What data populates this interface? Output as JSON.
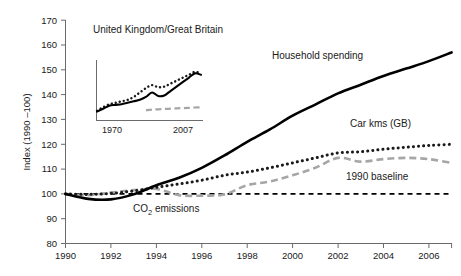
{
  "chart_data": {
    "type": "line",
    "title": "",
    "xlabel": "",
    "ylabel": "Index (1990 –100)",
    "xlim": [
      1990,
      2007
    ],
    "ylim": [
      80,
      170
    ],
    "grid": false,
    "legend_position": "inline-annotations",
    "x_tick_labels": [
      "1990",
      "1992",
      "1994",
      "1996",
      "1998",
      "2000",
      "2002",
      "2004",
      "2006"
    ],
    "y_tick_labels": [
      "80",
      "90",
      "100",
      "110",
      "120",
      "130",
      "140",
      "150",
      "160",
      "170"
    ],
    "x": [
      1990,
      1991,
      1992,
      1993,
      1994,
      1995,
      1996,
      1997,
      1998,
      1999,
      2000,
      2001,
      2002,
      2003,
      2004,
      2005,
      2006,
      2007
    ],
    "series": [
      {
        "name": "Household spending",
        "style": "solid",
        "color": "#000000",
        "values": [
          100,
          98,
          97.8,
          99.8,
          103.5,
          106.5,
          110.5,
          115.5,
          121,
          126,
          131.5,
          136,
          140.5,
          144,
          147.5,
          150.5,
          153.5,
          157
        ]
      },
      {
        "name": "Car kms (GB)",
        "style": "dotted",
        "color": "#1a1a1a",
        "values": [
          100,
          99.8,
          100.2,
          101.2,
          102.6,
          104,
          105.5,
          107.5,
          108.8,
          110.5,
          112.5,
          114.5,
          116.5,
          117,
          118,
          118.8,
          119.5,
          120
        ]
      },
      {
        "name": "CO2 emissions",
        "style": "dashed",
        "color": "#a6a6a6",
        "values": [
          100,
          99.5,
          100.5,
          101.5,
          102,
          99.5,
          99.3,
          99.8,
          103.5,
          105,
          107.5,
          110.5,
          114.5,
          113,
          114,
          114.5,
          114,
          112.5
        ]
      },
      {
        "name": "1990 baseline",
        "style": "dashed-baseline",
        "color": "#000000",
        "values": [
          100,
          100,
          100,
          100,
          100,
          100,
          100,
          100,
          100,
          100,
          100,
          100,
          100,
          100,
          100,
          100,
          100,
          100
        ]
      }
    ],
    "annotations": [
      {
        "key": "household_spending",
        "text": "Household spending"
      },
      {
        "key": "car_kms",
        "text": "Car kms (GB)"
      },
      {
        "key": "co2_emissions_prefix",
        "text": "CO"
      },
      {
        "key": "co2_emissions_sub",
        "text": "2"
      },
      {
        "key": "co2_emissions_suffix",
        "text": " emissions"
      },
      {
        "key": "baseline",
        "text": "1990 baseline"
      }
    ],
    "inset": {
      "title": "United Kingdom/Great Britain",
      "type": "line",
      "xlim": [
        1970,
        2007
      ],
      "x_tick_labels": [
        "1970",
        "2007"
      ],
      "series": [
        {
          "name": "Household spending",
          "style": "solid",
          "color": "#000000",
          "values": [
            134.5,
            135.5,
            136.5,
            136.8,
            137,
            137.5,
            138,
            138.5,
            139.5,
            141,
            139.8,
            140,
            141.5,
            143,
            144.5,
            146,
            147.5,
            147
          ]
        },
        {
          "name": "Car kms (GB)",
          "style": "dotted",
          "color": "#1a1a1a",
          "values": [
            134.8,
            136,
            137,
            137.5,
            138,
            138.5,
            139.5,
            141,
            142.5,
            143.5,
            142.8,
            143,
            144,
            145,
            146,
            147,
            148,
            147.5
          ]
        },
        {
          "name": "CO2 emissions",
          "style": "dashed",
          "color": "#a6a6a6",
          "values": [
            null,
            null,
            null,
            null,
            null,
            null,
            null,
            null,
            135,
            135.2,
            135.3,
            135.4,
            135.5,
            135.6,
            135.7,
            135.8,
            135.9,
            136
          ]
        }
      ]
    }
  }
}
